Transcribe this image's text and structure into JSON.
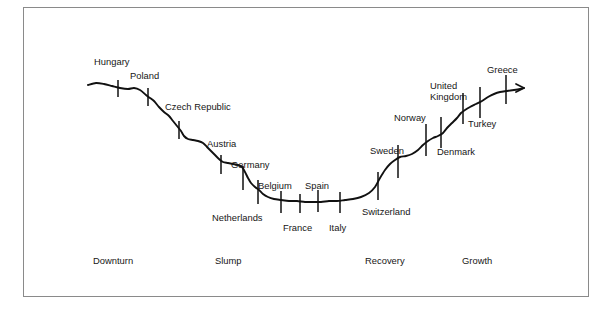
{
  "figure": {
    "frame_color": "#8a8a8a",
    "line_color": "#111111",
    "background": "#ffffff"
  },
  "chart_data": {
    "type": "line",
    "title": "",
    "subtitle": "",
    "xlabel": "",
    "ylabel": "",
    "grid": false,
    "legend": false,
    "axis_note": "Unlabeled schematic business-cycle curve; x = cycle phase (Downturn to Growth), y = relative economic position",
    "phases": [
      {
        "label": "Downturn",
        "x": 93,
        "y": 264
      },
      {
        "label": "Slump",
        "x": 215,
        "y": 264
      },
      {
        "label": "Recovery",
        "x": 365,
        "y": 264
      },
      {
        "label": "Growth",
        "x": 462,
        "y": 264
      }
    ],
    "curve_points": [
      [
        88,
        85
      ],
      [
        96,
        83
      ],
      [
        104,
        84
      ],
      [
        112,
        86
      ],
      [
        120,
        88
      ],
      [
        128,
        89
      ],
      [
        134,
        88
      ],
      [
        140,
        90
      ],
      [
        146,
        95
      ],
      [
        150,
        98
      ],
      [
        154,
        101
      ],
      [
        159,
        107
      ],
      [
        164,
        112
      ],
      [
        169,
        116
      ],
      [
        173,
        121
      ],
      [
        177,
        126
      ],
      [
        181,
        131
      ],
      [
        184,
        136
      ],
      [
        188,
        139
      ],
      [
        193,
        140
      ],
      [
        198,
        141
      ],
      [
        203,
        143
      ],
      [
        207,
        147
      ],
      [
        211,
        151
      ],
      [
        215,
        155
      ],
      [
        219,
        159
      ],
      [
        223,
        162
      ],
      [
        228,
        163
      ],
      [
        233,
        164
      ],
      [
        238,
        165
      ],
      [
        242,
        167
      ],
      [
        245,
        172
      ],
      [
        248,
        178
      ],
      [
        251,
        183
      ],
      [
        255,
        187
      ],
      [
        259,
        190
      ],
      [
        263,
        194
      ],
      [
        268,
        197
      ],
      [
        274,
        199
      ],
      [
        281,
        200
      ],
      [
        289,
        201
      ],
      [
        297,
        201
      ],
      [
        305,
        202
      ],
      [
        313,
        202
      ],
      [
        321,
        202
      ],
      [
        329,
        201
      ],
      [
        337,
        201
      ],
      [
        345,
        200
      ],
      [
        353,
        199
      ],
      [
        361,
        197
      ],
      [
        369,
        193
      ],
      [
        375,
        187
      ],
      [
        380,
        178
      ],
      [
        385,
        170
      ],
      [
        390,
        164
      ],
      [
        395,
        160
      ],
      [
        400,
        157
      ],
      [
        406,
        156
      ],
      [
        412,
        154
      ],
      [
        418,
        150
      ],
      [
        423,
        145
      ],
      [
        428,
        141
      ],
      [
        433,
        138
      ],
      [
        438,
        136
      ],
      [
        443,
        133
      ],
      [
        447,
        128
      ],
      [
        452,
        123
      ],
      [
        457,
        118
      ],
      [
        461,
        113
      ],
      [
        465,
        110
      ],
      [
        470,
        107
      ],
      [
        476,
        104
      ],
      [
        482,
        101
      ],
      [
        488,
        97
      ],
      [
        494,
        94
      ],
      [
        500,
        92
      ],
      [
        507,
        91
      ],
      [
        514,
        90
      ],
      [
        520,
        89
      ],
      [
        524,
        88
      ]
    ],
    "arrow_end": {
      "x": 524,
      "y": 88
    },
    "countries": [
      {
        "name": "Hungary",
        "tick_x": 118,
        "tick_y1": 80,
        "tick_y2": 97,
        "label_x": 94,
        "label_y": 65,
        "anchor": "start"
      },
      {
        "name": "Poland",
        "tick_x": 148,
        "tick_y1": 88,
        "tick_y2": 106,
        "label_x": 130,
        "label_y": 79,
        "anchor": "start"
      },
      {
        "name": "Czech Republic",
        "tick_x": 179,
        "tick_y1": 121,
        "tick_y2": 139,
        "label_x": 165,
        "label_y": 110,
        "anchor": "start"
      },
      {
        "name": "Austria",
        "tick_x": 221,
        "tick_y1": 155,
        "tick_y2": 174,
        "label_x": 207,
        "label_y": 147,
        "anchor": "start"
      },
      {
        "name": "Germany",
        "tick_x": 243,
        "tick_y1": 166,
        "tick_y2": 190,
        "label_x": 231,
        "label_y": 168,
        "anchor": "start"
      },
      {
        "name": "Netherlands",
        "tick_x": 258,
        "tick_y1": 180,
        "tick_y2": 204,
        "label_x": 212,
        "label_y": 221,
        "anchor": "start"
      },
      {
        "name": "Belgium",
        "tick_x": 281,
        "tick_y1": 191,
        "tick_y2": 213,
        "label_x": 258,
        "label_y": 189,
        "anchor": "start"
      },
      {
        "name": "France",
        "tick_x": 300,
        "tick_y1": 194,
        "tick_y2": 213,
        "label_x": 283,
        "label_y": 231,
        "anchor": "start"
      },
      {
        "name": "Spain",
        "tick_x": 318,
        "tick_y1": 190,
        "tick_y2": 212,
        "label_x": 305,
        "label_y": 189,
        "anchor": "start"
      },
      {
        "name": "Italy",
        "tick_x": 340,
        "tick_y1": 192,
        "tick_y2": 213,
        "label_x": 329,
        "label_y": 231,
        "anchor": "start"
      },
      {
        "name": "Switzerland",
        "tick_x": 378,
        "tick_y1": 172,
        "tick_y2": 200,
        "label_x": 362,
        "label_y": 215,
        "anchor": "start"
      },
      {
        "name": "Sweden",
        "tick_x": 398,
        "tick_y1": 145,
        "tick_y2": 178,
        "label_x": 370,
        "label_y": 154,
        "anchor": "start"
      },
      {
        "name": "Norway",
        "tick_x": 426,
        "tick_y1": 124,
        "tick_y2": 156,
        "label_x": 394,
        "label_y": 121,
        "anchor": "start"
      },
      {
        "name": "Denmark",
        "tick_x": 441,
        "tick_y1": 117,
        "tick_y2": 148,
        "label_x": 437,
        "label_y": 155,
        "anchor": "start"
      },
      {
        "name": "Turkey",
        "tick_x": 463,
        "tick_y1": 93,
        "tick_y2": 124,
        "label_x": 468,
        "label_y": 127,
        "anchor": "start"
      },
      {
        "name": "United Kingdom",
        "tick_x": 480,
        "tick_y1": 87,
        "tick_y2": 118,
        "label_x": 430,
        "label_y": 89,
        "anchor": "start"
      },
      {
        "name": "Greece",
        "tick_x": 506,
        "tick_y1": 75,
        "tick_y2": 104,
        "label_x": 487,
        "label_y": 73,
        "anchor": "start"
      }
    ],
    "multiline_labels": {
      "United Kingdom": [
        "United",
        "Kingdom"
      ]
    }
  }
}
